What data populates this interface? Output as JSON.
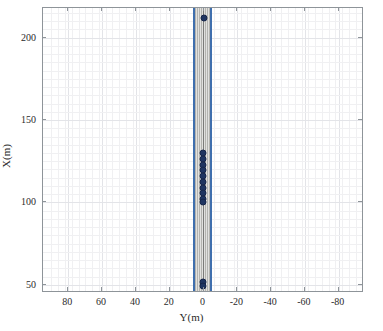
{
  "figure": {
    "background": "#ffffff",
    "plot_area": {
      "left": 42,
      "top": 7,
      "width": 321,
      "height": 285
    },
    "frame_color": "#8e9499"
  },
  "axes": {
    "x": {
      "label": "Y(m)",
      "ticks": [
        80,
        60,
        40,
        20,
        0,
        -20,
        -40,
        -60,
        -80
      ],
      "tick_labels": [
        "80",
        "60",
        "40",
        "20",
        "0",
        "-20",
        "-40",
        "-60",
        "-80"
      ],
      "limits": [
        95,
        -95
      ],
      "reversed": true,
      "minor_grid": true
    },
    "y": {
      "label": "X(m)",
      "ticks": [
        50,
        100,
        150,
        200
      ],
      "tick_labels": [
        "50",
        "100",
        "150",
        "200"
      ],
      "limits": [
        45,
        218
      ],
      "minor_grid": true
    },
    "grid": true
  },
  "chart_data": {
    "type": "scatter",
    "title": "",
    "xlabel": "Y(m)",
    "ylabel": "X(m)",
    "xlim": [
      95,
      -95
    ],
    "ylim": [
      45,
      218
    ],
    "grid": true,
    "legend": null,
    "series": [
      {
        "name": "road-corridor-band",
        "type": "area",
        "description": "shaded lane corridor spanning full X range",
        "fill_color": "#b9b9b4",
        "edge_color": "#3f6fae",
        "y_left_edge": 5.5,
        "y_right_edge": -4.5
      },
      {
        "name": "lane-center-line",
        "type": "line",
        "color": "#7b7b78",
        "y_value": 0.5
      },
      {
        "name": "vehicle-positions",
        "type": "scatter",
        "marker": "filled-circle",
        "color": "#1f3561",
        "points": [
          {
            "y": 0.0,
            "x": 212.0
          },
          {
            "y": 0.6,
            "x": 130.0
          },
          {
            "y": 0.6,
            "x": 126.5
          },
          {
            "y": 0.6,
            "x": 123.0
          },
          {
            "y": 0.6,
            "x": 119.5
          },
          {
            "y": 0.6,
            "x": 116.0
          },
          {
            "y": 0.6,
            "x": 112.5
          },
          {
            "y": 0.6,
            "x": 109.0
          },
          {
            "y": 0.6,
            "x": 105.5
          },
          {
            "y": 0.6,
            "x": 102.0
          },
          {
            "y": 0.6,
            "x": 100.0
          },
          {
            "y": 0.3,
            "x": 51.5
          },
          {
            "y": 0.3,
            "x": 49.5
          }
        ]
      }
    ]
  }
}
